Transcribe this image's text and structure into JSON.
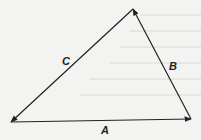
{
  "diagram": {
    "type": "vector-triangle",
    "vertices": {
      "left": [
        11,
        122
      ],
      "right": [
        191,
        119
      ],
      "top": [
        133,
        9
      ]
    },
    "vectors": [
      {
        "label": "A",
        "from": "left",
        "to": "right",
        "label_pos": [
          104,
          134
        ]
      },
      {
        "label": "B",
        "from": "right",
        "to": "top",
        "label_pos": [
          171,
          69
        ]
      },
      {
        "label": "C",
        "from": "top",
        "to": "left",
        "label_pos": [
          63,
          64
        ]
      }
    ],
    "colors": {
      "line": "#222222",
      "background": "#f3f3f1"
    }
  }
}
